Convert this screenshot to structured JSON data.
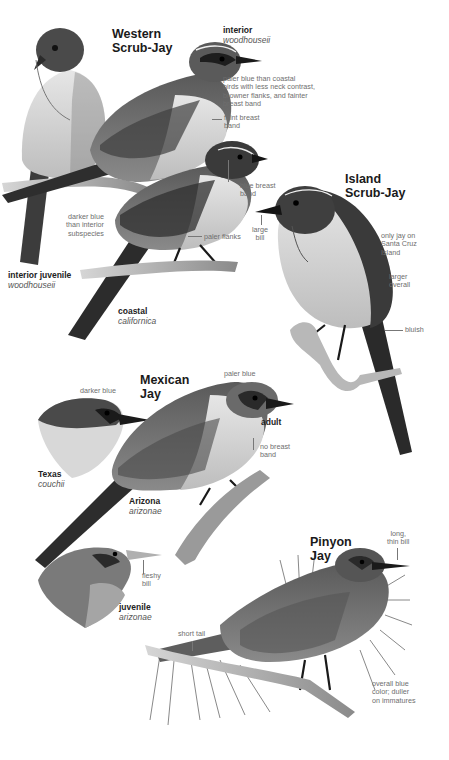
{
  "page": {
    "background": "#ffffff",
    "palette": {
      "ink_dark": "#1e1e1e",
      "ink_mid": "#6e6e6e",
      "bird_dark": "#3a3a3a",
      "bird_mid": "#7a7a7a",
      "bird_light": "#d8d8d8"
    }
  },
  "species": [
    {
      "name_line1": "Western",
      "name_line2": "Scrub-Jay",
      "forms": [
        {
          "label": "interior",
          "subspecies": "woodhouseii"
        },
        {
          "label": "interior juvenile",
          "subspecies": "woodhouseii"
        },
        {
          "label": "coastal",
          "subspecies": "californica"
        }
      ],
      "notes": {
        "interior_paler": [
          "paler blue than coastal",
          "birds with less neck contrast,",
          "browner flanks, and fainter",
          "breast band"
        ],
        "faint_band": [
          "faint breast",
          "band"
        ],
        "blue_band": [
          "blue breast",
          "band"
        ],
        "darker_blue": [
          "darker blue",
          "than interior",
          "subspecies"
        ],
        "paler_flanks": "paler flanks"
      }
    },
    {
      "name_line1": "Island",
      "name_line2": "Scrub-Jay",
      "notes": {
        "large_bill": [
          "large",
          "bill"
        ],
        "only_jay": [
          "only jay on",
          "Santa Cruz",
          "Island"
        ],
        "larger": [
          "larger",
          "overall"
        ],
        "bluish": "bluish"
      }
    },
    {
      "name_line1": "Mexican",
      "name_line2": "Jay",
      "forms": [
        {
          "label": "adult"
        },
        {
          "label": "Texas",
          "subspecies": "couchii"
        },
        {
          "label": "Arizona",
          "subspecies": "arizonae"
        },
        {
          "label": "juvenile",
          "subspecies": "arizonae"
        }
      ],
      "notes": {
        "darker_blue": "darker blue",
        "paler_blue": "paler blue",
        "no_band": [
          "no breast",
          "band"
        ],
        "fleshy_bill": [
          "fleshy",
          "bill"
        ]
      }
    },
    {
      "name_line1": "Pinyon",
      "name_line2": "Jay",
      "notes": {
        "long_bill": [
          "long,",
          "thin bill"
        ],
        "short_tail": "short tail",
        "overall_blue": [
          "overall blue",
          "color; duller",
          "on immatures"
        ]
      }
    }
  ]
}
